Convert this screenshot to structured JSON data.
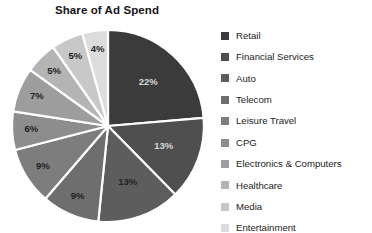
{
  "chart_data": {
    "type": "pie",
    "title": "Share of Ad Spend",
    "xlabel": "",
    "ylabel": "",
    "legend_position": "right",
    "grid": false,
    "start_angle_deg": 0,
    "direction": "clockwise",
    "categories": [
      "Retail",
      "Financial Services",
      "Auto",
      "Telecom",
      "Leisure Travel",
      "CPG",
      "Electronics & Computers",
      "Healthcare",
      "Media",
      "Entertainment"
    ],
    "values": [
      22,
      13,
      13,
      9,
      9,
      6,
      7,
      5,
      5,
      4
    ],
    "value_labels": [
      "22%",
      "13%",
      "13%",
      "9%",
      "9%",
      "6%",
      "7%",
      "5%",
      "5%",
      "4%"
    ],
    "colors": [
      "#3b3b3b",
      "#4f4f4f",
      "#5d5d5d",
      "#6e6e6e",
      "#7d7d7d",
      "#8d8d8d",
      "#9d9d9d",
      "#b4b4b4",
      "#c8c8c8",
      "#dcdcdc"
    ],
    "label_text_colors": [
      "#d8d8d8",
      "#d8d8d8",
      "#1f1f1f",
      "#1f1f1f",
      "#1f1f1f",
      "#1f1f1f",
      "#1f1f1f",
      "#1f1f1f",
      "#1f1f1f",
      "#1f1f1f"
    ]
  },
  "legend": {
    "items": [
      {
        "label": "Retail",
        "color": "#3b3b3b"
      },
      {
        "label": "Financial Services",
        "color": "#4f4f4f"
      },
      {
        "label": "Auto",
        "color": "#5d5d5d"
      },
      {
        "label": "Telecom",
        "color": "#6e6e6e"
      },
      {
        "label": "Leisure Travel",
        "color": "#7d7d7d"
      },
      {
        "label": "CPG",
        "color": "#8d8d8d"
      },
      {
        "label": "Electronics & Computers",
        "color": "#9d9d9d"
      },
      {
        "label": "Healthcare",
        "color": "#b4b4b4"
      },
      {
        "label": "Media",
        "color": "#c8c8c8"
      },
      {
        "label": "Entertainment",
        "color": "#dcdcdc"
      }
    ]
  }
}
